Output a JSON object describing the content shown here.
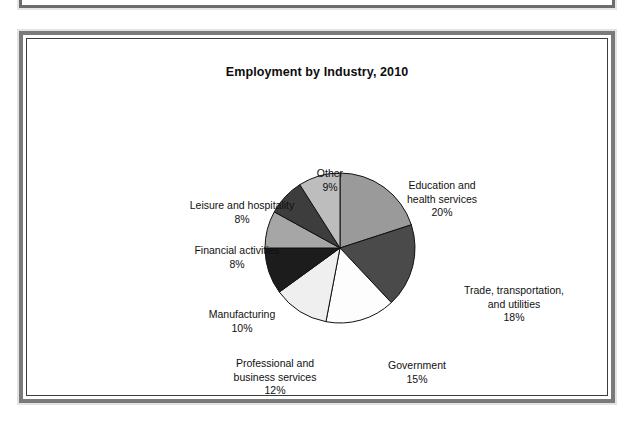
{
  "slide": {
    "title": "Employment by Industry, 2010"
  },
  "chart_data": {
    "type": "pie",
    "title": "Employment by Industry, 2010",
    "xlabel": "",
    "ylabel": "",
    "legend_position": "none",
    "value_unit": "percent",
    "start_angle_deg": 0,
    "direction": "clockwise",
    "categories": [
      "Education and health services",
      "Trade, transportation, and utilities",
      "Government",
      "Professional and business services",
      "Manufacturing",
      "Financial activities",
      "Leisure and hospitality",
      "Other"
    ],
    "values": [
      20,
      18,
      15,
      12,
      10,
      8,
      8,
      9
    ],
    "slices": [
      {
        "label": "Education and health services",
        "label_line1": "Education and",
        "label_line2": "health services",
        "value": 20,
        "pct_text": "20%",
        "color": "#9a9a9a"
      },
      {
        "label": "Trade, transportation, and utilities",
        "label_line1": "Trade, transportation,",
        "label_line2": "and utilities",
        "value": 18,
        "pct_text": "18%",
        "color": "#4a4a4a"
      },
      {
        "label": "Government",
        "label_line1": "Government",
        "label_line2": "",
        "value": 15,
        "pct_text": "15%",
        "color": "#fdfdfd"
      },
      {
        "label": "Professional and business services",
        "label_line1": "Professional and",
        "label_line2": "business services",
        "value": 12,
        "pct_text": "12%",
        "color": "#efefef"
      },
      {
        "label": "Manufacturing",
        "label_line1": "Manufacturing",
        "label_line2": "",
        "value": 10,
        "pct_text": "10%",
        "color": "#1c1c1c"
      },
      {
        "label": "Financial activities",
        "label_line1": "Financial activities",
        "label_line2": "",
        "value": 8,
        "pct_text": "8%",
        "color": "#a6a6a6"
      },
      {
        "label": "Leisure and hospitality",
        "label_line1": "Leisure and hospitality",
        "label_line2": "",
        "value": 8,
        "pct_text": "8%",
        "color": "#3d3d3d"
      },
      {
        "label": "Other",
        "label_line1": "Other",
        "label_line2": "",
        "value": 9,
        "pct_text": "9%",
        "color": "#bdbdbd"
      }
    ],
    "geometry": {
      "cx": 336,
      "cy": 243,
      "r": 75
    }
  },
  "colors": {
    "frame_outer": "#7a7a7a",
    "frame_inner": "#3c3c3c",
    "page_background": "#ffffff",
    "text": "#101010"
  }
}
